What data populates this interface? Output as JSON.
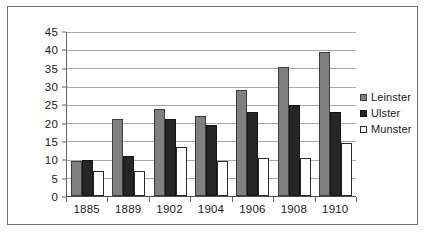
{
  "chart_data": {
    "type": "bar",
    "title": "",
    "subtitle": "",
    "xlabel": "",
    "ylabel": "",
    "categories": [
      "1885",
      "1889",
      "1902",
      "1904",
      "1906",
      "1908",
      "1910"
    ],
    "series": [
      {
        "name": "Leinster",
        "color": "#808080",
        "values": [
          9.5,
          21,
          24,
          22,
          29,
          35.5,
          39.5
        ]
      },
      {
        "name": "Ulster",
        "color": "#262626",
        "values": [
          10,
          11,
          21,
          19.5,
          23,
          25,
          23
        ]
      },
      {
        "name": "Munster",
        "color": "#ffffff",
        "values": [
          7,
          7,
          13.5,
          9.5,
          10.5,
          10.5,
          14.5
        ]
      }
    ],
    "ylim": [
      0,
      45
    ],
    "ytick_step": 5,
    "yticks": [
      "45",
      "40",
      "35",
      "30",
      "25",
      "20",
      "15",
      "10",
      "5",
      "0"
    ],
    "grid": true,
    "grid_axis": "y",
    "legend_position": "right",
    "legend": [
      "Leinster",
      "Ulster",
      "Munster"
    ]
  },
  "colors": {
    "leinster": "#808080",
    "ulster": "#262626",
    "munster": "#ffffff",
    "gridline": "#a8a8a8",
    "axis": "#666666",
    "frame": "#6e6e6e",
    "text": "#1a1a1a",
    "background": "#ffffff"
  }
}
